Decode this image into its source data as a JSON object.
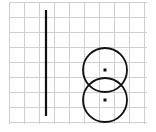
{
  "diagram": {
    "background": "#ffffff",
    "grid": {
      "color": "#cfcfcf",
      "spacing": 15,
      "x_lines": [
        9,
        24,
        39,
        54,
        69,
        84,
        99,
        114,
        129,
        144
      ],
      "y_lines": [
        2,
        17,
        32,
        47,
        62,
        77,
        92,
        107,
        122
      ],
      "x_start": 9,
      "x_end": 147,
      "y_start": 2,
      "y_end": 124
    },
    "vertical_line": {
      "x": 46,
      "y1": 10,
      "y2": 116,
      "color": "#111111",
      "width": 2.2
    },
    "circles": [
      {
        "name": "upper-circle",
        "cx": 105,
        "cy": 70,
        "r": 22,
        "stroke": "#111111",
        "width": 1.8
      },
      {
        "name": "lower-circle",
        "cx": 105,
        "cy": 100,
        "r": 22,
        "stroke": "#111111",
        "width": 1.8
      }
    ],
    "center_points": [
      {
        "name": "upper-center-dot",
        "x": 105,
        "y": 70,
        "size": 3
      },
      {
        "name": "lower-center-dot",
        "x": 105,
        "y": 100,
        "size": 3
      }
    ]
  }
}
